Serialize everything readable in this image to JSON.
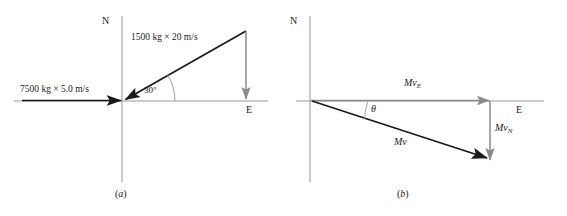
{
  "figure": {
    "type": "vector-diagram",
    "background_color": "#ffffff",
    "ink_color": "#1a1a1a",
    "secondary_color": "#8a8a8a",
    "axis_color": "#9a9a9a",
    "panels": [
      {
        "id": "a",
        "caption": "(a)",
        "caption_label": "a",
        "axes": {
          "north_label": "N",
          "east_label": "E"
        },
        "vectors": [
          {
            "name": "truck-momentum",
            "label": "7500 kg × 5.0 m/s",
            "mass": "7500 kg",
            "speed": "5.0 m/s",
            "direction": "east-pointing-west-arrow",
            "color": "#1a1a1a"
          },
          {
            "name": "car-momentum",
            "label": "1500 kg × 20 m/s",
            "mass": "1500 kg",
            "speed": "20 m/s",
            "direction": "southwest-diagonal",
            "color": "#1a1a1a"
          },
          {
            "name": "car-momentum-north-component",
            "label": "",
            "direction": "downward-vertical",
            "color": "#8a8a8a"
          }
        ],
        "angle": {
          "name": "thirty-degree-angle",
          "label": "30°",
          "value": 30,
          "unit": "degrees"
        }
      },
      {
        "id": "b",
        "caption": "(b)",
        "caption_label": "b",
        "axes": {
          "north_label": "N",
          "east_label": "E"
        },
        "vectors": [
          {
            "name": "resultant-east-component",
            "label_base": "Mv",
            "label_sub": "E",
            "direction": "east",
            "color": "#8a8a8a"
          },
          {
            "name": "resultant-north-component",
            "label_base": "Mv",
            "label_sub": "N",
            "direction": "south",
            "color": "#8a8a8a"
          },
          {
            "name": "resultant-momentum",
            "label_base": "Mv",
            "label_sub": "",
            "direction": "southeast-diagonal",
            "color": "#1a1a1a"
          }
        ],
        "angle": {
          "name": "theta-angle",
          "label": "θ",
          "value": "θ"
        }
      }
    ]
  }
}
